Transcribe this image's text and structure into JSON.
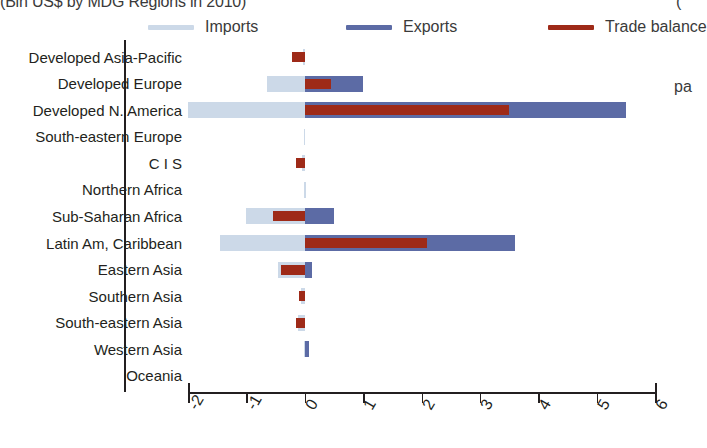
{
  "title": {
    "text": "(Bln US$ by MDG Regions in 2010)",
    "right_fragment": "("
  },
  "side_note": "pa",
  "legend": {
    "position": "top",
    "items": [
      {
        "label": "Imports",
        "color": "#ccd9e8"
      },
      {
        "label": "Exports",
        "color": "#5c6ba5"
      },
      {
        "label": "Trade balance",
        "color": "#9e2a18"
      }
    ]
  },
  "axis": {
    "x_ticks": [
      "-2",
      "-1",
      "0",
      "1",
      "2",
      "3",
      "4",
      "5",
      "6"
    ],
    "x_min": -2,
    "x_max": 6
  },
  "chart_data": {
    "type": "bar",
    "orientation": "horizontal",
    "title": "(Bln US$ by MDG Regions in 2010)",
    "xlabel": "",
    "ylabel": "",
    "xlim": [
      -2,
      6
    ],
    "grid": false,
    "legend_position": "top",
    "categories": [
      "Developed Asia-Pacific",
      "Developed Europe",
      "Developed N. America",
      "South-eastern Europe",
      "C I S",
      "Northern Africa",
      "Sub-Saharan Africa",
      "Latin Am, Caribbean",
      "Eastern Asia",
      "Southern Asia",
      "South-eastern Asia",
      "Western Asia",
      "Oceania"
    ],
    "series": [
      {
        "name": "Imports",
        "color": "#ccd9e8",
        "values": [
          -0.03,
          -0.65,
          -2.0,
          -0.02,
          -0.05,
          -0.01,
          -1.0,
          -1.45,
          -0.45,
          -0.07,
          -0.12,
          -0.02,
          0.0
        ]
      },
      {
        "name": "Exports",
        "color": "#5c6ba5",
        "values": [
          0.0,
          1.0,
          5.5,
          0.0,
          0.0,
          0.0,
          0.5,
          3.6,
          0.12,
          0.0,
          0.0,
          0.07,
          0.0
        ]
      },
      {
        "name": "Trade balance",
        "color": "#9e2a18",
        "values": [
          -0.22,
          0.45,
          3.5,
          0.0,
          -0.15,
          0.0,
          -0.55,
          2.1,
          -0.4,
          -0.1,
          -0.15,
          0.0,
          0.0
        ]
      }
    ]
  }
}
